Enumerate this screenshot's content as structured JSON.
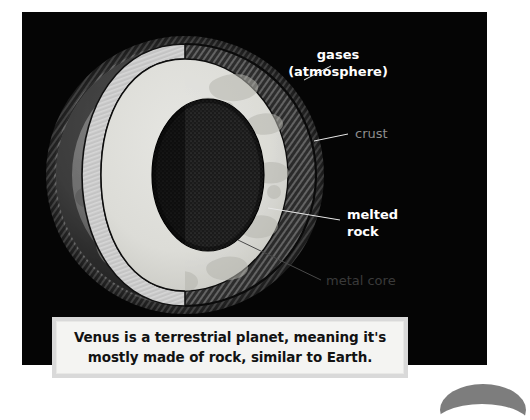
{
  "page": {
    "background_color": "#ffffff",
    "panel_color": "#050505"
  },
  "diagram": {
    "subject": "Venus",
    "type": "planet-cutaway-cross-section",
    "labels": [
      {
        "id": "atmosphere",
        "text_line1": "gases",
        "text_line2": "(atmosphere)",
        "style": "bright",
        "color": "#ffffff"
      },
      {
        "id": "crust",
        "text_line1": "crust",
        "text_line2": "",
        "style": "dim",
        "color": "#8e8e8e"
      },
      {
        "id": "melted-rock",
        "text_line1": "melted",
        "text_line2": "rock",
        "style": "bright",
        "color": "#ffffff"
      },
      {
        "id": "metal-core",
        "text_line1": "metal core",
        "text_line2": "",
        "style": "dark",
        "color": "#3a3a3a"
      }
    ],
    "layers": {
      "atmosphere_color": "#2a2a2a",
      "surface_color": "#6e6e6e",
      "crust_color": "#c9c9c9",
      "mantle_color": "#d8d8d4",
      "core_color": "#1c1c1c"
    }
  },
  "caption": {
    "line1": "Venus is a terrestrial planet, meaning it's",
    "line2": "mostly made of rock, similar to Earth.",
    "full_text": "Venus is a terrestrial planet, meaning it's mostly made of rock, similar to Earth.",
    "background_color": "#f4f4f2",
    "border_color": "#d9d9d9",
    "text_color": "#121212"
  }
}
